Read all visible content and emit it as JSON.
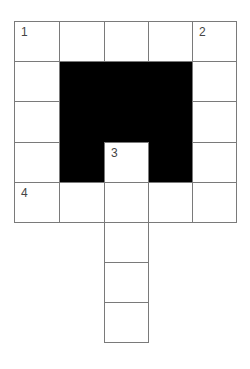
{
  "puzzle": {
    "type": "crossword",
    "rows": 8,
    "cols": 5,
    "cells": [
      {
        "r": 0,
        "c": 0,
        "num": "1"
      },
      {
        "r": 0,
        "c": 1
      },
      {
        "r": 0,
        "c": 2
      },
      {
        "r": 0,
        "c": 3
      },
      {
        "r": 0,
        "c": 4,
        "num": "2"
      },
      {
        "r": 1,
        "c": 0
      },
      {
        "r": 1,
        "c": 4
      },
      {
        "r": 2,
        "c": 0
      },
      {
        "r": 2,
        "c": 4
      },
      {
        "r": 3,
        "c": 0
      },
      {
        "r": 3,
        "c": 2,
        "num": "3"
      },
      {
        "r": 3,
        "c": 4
      },
      {
        "r": 4,
        "c": 0,
        "num": "4"
      },
      {
        "r": 4,
        "c": 1
      },
      {
        "r": 4,
        "c": 2
      },
      {
        "r": 4,
        "c": 3
      },
      {
        "r": 4,
        "c": 4
      },
      {
        "r": 5,
        "c": 2
      },
      {
        "r": 6,
        "c": 2
      },
      {
        "r": 7,
        "c": 2
      }
    ],
    "numbers": {
      "n1": "1",
      "n2": "2",
      "n3": "3",
      "n4": "4"
    },
    "colors": {
      "line": "#7a7a7a",
      "black": "#000000",
      "number": "#444444"
    }
  }
}
